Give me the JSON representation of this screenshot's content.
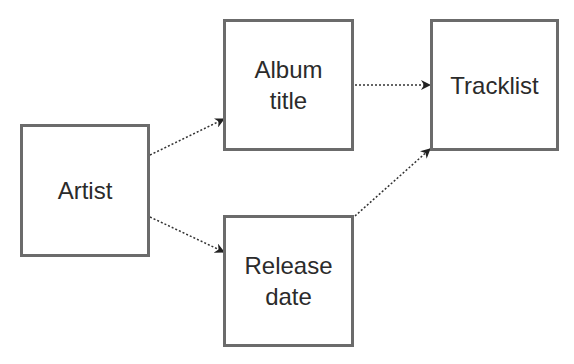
{
  "diagram": {
    "type": "flow",
    "colors": {
      "border": "#6b6b6b",
      "text": "#2b2b2b",
      "edge": "#333333",
      "background": "#ffffff"
    },
    "nodes": [
      {
        "id": "artist",
        "label": "Artist",
        "lines": [
          "Artist"
        ],
        "box": [
          20,
          124,
          130,
          133
        ]
      },
      {
        "id": "album_title",
        "label": "Album title",
        "lines": [
          "Album",
          "title"
        ],
        "box": [
          223,
          19,
          131,
          132
        ]
      },
      {
        "id": "tracklist",
        "label": "Tracklist",
        "lines": [
          "Tracklist"
        ],
        "box": [
          430,
          19,
          129,
          132
        ]
      },
      {
        "id": "release_date",
        "label": "Release date",
        "lines": [
          "Release",
          "date"
        ],
        "box": [
          223,
          215,
          131,
          132
        ]
      }
    ],
    "edges": [
      {
        "from": "artist",
        "to": "album_title",
        "style": "dotted",
        "points": [
          150,
          155,
          224,
          119
        ]
      },
      {
        "from": "artist",
        "to": "release_date",
        "style": "dotted",
        "points": [
          150,
          217,
          224,
          252
        ]
      },
      {
        "from": "album_title",
        "to": "tracklist",
        "style": "dotted",
        "points": [
          355,
          85,
          430,
          85
        ]
      },
      {
        "from": "release_date",
        "to": "tracklist",
        "style": "dotted",
        "points": [
          355,
          216,
          430,
          149
        ]
      }
    ]
  }
}
